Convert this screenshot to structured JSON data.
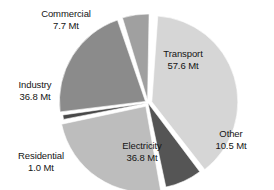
{
  "chart_data": {
    "type": "pie",
    "title": "",
    "subtitle": "",
    "xlabel": "",
    "ylabel": "",
    "unit": "Mt",
    "total": "150.4 Mt",
    "legend_position": "none",
    "grid": false,
    "categories": [
      "Transport",
      "Other",
      "Electricity",
      "Residential",
      "Industry",
      "Commercial"
    ],
    "values": [
      57.6,
      10.5,
      36.8,
      1.0,
      36.8,
      7.7
    ],
    "slices": [
      {
        "label": "Transport",
        "value_text": "57.6 Mt",
        "value": 57.6,
        "color": "#d6d6d6",
        "label_placement": "inside",
        "start_angle": 4,
        "end_angle": 142,
        "explode": 4
      },
      {
        "label": "Other",
        "value_text": "10.5 Mt",
        "value": 10.5,
        "color": "#555555",
        "label_placement": "outside",
        "start_angle": 143,
        "end_angle": 168,
        "explode": 0
      },
      {
        "label": "Electricity",
        "value_text": "36.8 Mt",
        "value": 36.8,
        "color": "#bdbdbd",
        "label_placement": "inside",
        "start_angle": 170,
        "end_angle": 258,
        "explode": 4
      },
      {
        "label": "Residential",
        "value_text": "1.0 Mt",
        "value": 1.0,
        "color": "#484848",
        "label_placement": "outside",
        "start_angle": 259,
        "end_angle": 262,
        "explode": 0
      },
      {
        "label": "Industry",
        "value_text": "36.8 Mt",
        "value": 36.8,
        "color": "#8b8b8b",
        "label_placement": "outside",
        "start_angle": 263,
        "end_angle": 341,
        "explode": 3
      },
      {
        "label": "Commercial",
        "value_text": "7.7 Mt",
        "value": 7.7,
        "color": "#a0a0a0",
        "label_placement": "outside",
        "start_angle": 343,
        "end_angle": 361,
        "explode": 3
      }
    ],
    "geometry": {
      "cx": 148,
      "cy": 103,
      "radius": 86
    }
  },
  "labels": {
    "transport": {
      "name": "Transport",
      "value": "57.6 Mt"
    },
    "other": {
      "name": "Other",
      "value": "10.5 Mt"
    },
    "electricity": {
      "name": "Electricity",
      "value": "36.8 Mt"
    },
    "residential": {
      "name": "Residential",
      "value": "1.0 Mt"
    },
    "industry": {
      "name": "Industry",
      "value": "36.8 Mt"
    },
    "commercial": {
      "name": "Commercial",
      "value": "7.7 Mt"
    }
  }
}
